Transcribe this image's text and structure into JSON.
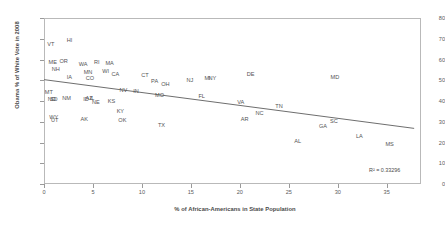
{
  "chart_data": {
    "type": "scatter",
    "title": "",
    "xlabel": "% of African-Americans in State Population",
    "ylabel": "Obama % of White Vote in 2008",
    "xlim": [
      0,
      38.5
    ],
    "ylim": [
      0,
      80
    ],
    "xticks": [
      "0",
      "5",
      "10",
      "15",
      "20",
      "25",
      "30",
      "35"
    ],
    "xtick_values": [
      0,
      5,
      10,
      15,
      20,
      25,
      30,
      35
    ],
    "yticks": [
      "0",
      "10",
      "20",
      "30",
      "40",
      "50",
      "60",
      "70",
      "80"
    ],
    "ytick_values": [
      0,
      10,
      20,
      30,
      40,
      50,
      60,
      70,
      80
    ],
    "grid": false,
    "legend": false,
    "annotation": "R² = 0.33296",
    "point_label_field": "state",
    "trendline": {
      "type": "linear",
      "x_start": 0.0,
      "y_start": 50.3,
      "x_end": 37.8,
      "y_end": 26.8,
      "r_squared": 0.33296
    },
    "points": [
      {
        "state": "VT",
        "x": 0.7,
        "y": 67.5
      },
      {
        "state": "HI",
        "x": 2.6,
        "y": 69.5
      },
      {
        "state": "ME",
        "x": 0.9,
        "y": 59.0
      },
      {
        "state": "OR",
        "x": 2.0,
        "y": 59.5
      },
      {
        "state": "WA",
        "x": 4.0,
        "y": 58.0
      },
      {
        "state": "RI",
        "x": 5.4,
        "y": 59.0
      },
      {
        "state": "MA",
        "x": 6.7,
        "y": 58.2
      },
      {
        "state": "NH",
        "x": 1.2,
        "y": 55.2
      },
      {
        "state": "MN",
        "x": 4.5,
        "y": 54.0
      },
      {
        "state": "WI",
        "x": 6.3,
        "y": 54.6
      },
      {
        "state": "CA",
        "x": 7.3,
        "y": 53.0
      },
      {
        "state": "IA",
        "x": 2.6,
        "y": 51.4
      },
      {
        "state": "CO",
        "x": 4.7,
        "y": 51.2
      },
      {
        "state": "CT",
        "x": 10.3,
        "y": 52.5
      },
      {
        "state": "PA",
        "x": 11.3,
        "y": 49.6
      },
      {
        "state": "NJ",
        "x": 14.9,
        "y": 50.3
      },
      {
        "state": "MI",
        "x": 16.7,
        "y": 51.0
      },
      {
        "state": "NY",
        "x": 17.2,
        "y": 51.3
      },
      {
        "state": "DE",
        "x": 21.1,
        "y": 52.8
      },
      {
        "state": "MD",
        "x": 29.7,
        "y": 51.5
      },
      {
        "state": "MT",
        "x": 0.5,
        "y": 44.5
      },
      {
        "state": "NV",
        "x": 8.1,
        "y": 45.5
      },
      {
        "state": "IN",
        "x": 9.4,
        "y": 45.0
      },
      {
        "state": "OH",
        "x": 12.4,
        "y": 48.3
      },
      {
        "state": "MO",
        "x": 11.8,
        "y": 43.0
      },
      {
        "state": "FL",
        "x": 16.1,
        "y": 42.5
      },
      {
        "state": "ND",
        "x": 0.8,
        "y": 41.2
      },
      {
        "state": "SD",
        "x": 1.0,
        "y": 41.0
      },
      {
        "state": "NM",
        "x": 2.3,
        "y": 41.5
      },
      {
        "state": "ID",
        "x": 4.3,
        "y": 41.0
      },
      {
        "state": "AZ",
        "x": 4.6,
        "y": 41.3
      },
      {
        "state": "IL",
        "x": 4.9,
        "y": 41.5
      },
      {
        "state": "NE",
        "x": 5.3,
        "y": 39.5
      },
      {
        "state": "KS",
        "x": 6.9,
        "y": 40.0
      },
      {
        "state": "VA",
        "x": 20.1,
        "y": 39.5
      },
      {
        "state": "TN",
        "x": 24.0,
        "y": 37.5
      },
      {
        "state": "WY",
        "x": 1.0,
        "y": 32.5
      },
      {
        "state": "UT",
        "x": 1.1,
        "y": 31.0
      },
      {
        "state": "AK",
        "x": 4.1,
        "y": 31.5
      },
      {
        "state": "KY",
        "x": 7.8,
        "y": 35.0
      },
      {
        "state": "OK",
        "x": 8.0,
        "y": 31.0
      },
      {
        "state": "NC",
        "x": 22.0,
        "y": 34.0
      },
      {
        "state": "AR",
        "x": 20.5,
        "y": 31.5
      },
      {
        "state": "TX",
        "x": 12.0,
        "y": 28.5
      },
      {
        "state": "SC",
        "x": 29.6,
        "y": 30.5
      },
      {
        "state": "GA",
        "x": 28.5,
        "y": 28.0
      },
      {
        "state": "LA",
        "x": 32.2,
        "y": 23.0
      },
      {
        "state": "AL",
        "x": 25.9,
        "y": 20.5
      },
      {
        "state": "MS",
        "x": 35.3,
        "y": 19.5
      }
    ]
  }
}
